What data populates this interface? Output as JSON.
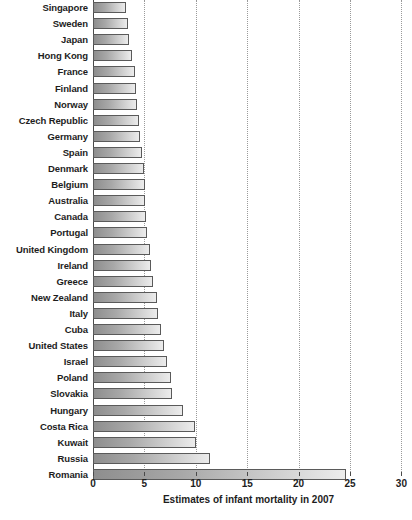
{
  "chart_data": {
    "type": "bar",
    "orientation": "horizontal",
    "title": "",
    "xlabel": "Estimates of infant mortality in 2007",
    "ylabel": "",
    "xlim": [
      0,
      30
    ],
    "xticks": [
      0,
      5,
      10,
      15,
      20,
      25,
      30
    ],
    "xtick_labels": [
      "0",
      "5",
      "10",
      "15",
      "20",
      "25",
      "30"
    ],
    "grid": true,
    "grid_axis": "x",
    "legend": "none",
    "bar_color": "#a8a8a8",
    "bar_edge_color": "#5a5a5a",
    "categories": [
      "Singapore",
      "Sweden",
      "Japan",
      "Hong Kong",
      "France",
      "Finland",
      "Norway",
      "Czech Republic",
      "Germany",
      "Spain",
      "Denmark",
      "Belgium",
      "Australia",
      "Canada",
      "Portugal",
      "United Kingdom",
      "Ireland",
      "Greece",
      "New Zealand",
      "Italy",
      "Cuba",
      "United States",
      "Israel",
      "Poland",
      "Slovakia",
      "Hungary",
      "Costa Rica",
      "Kuwait",
      "Russia",
      "Romania"
    ],
    "values": [
      3.2,
      3.4,
      3.5,
      3.8,
      4.1,
      4.2,
      4.3,
      4.5,
      4.6,
      4.8,
      5.0,
      5.1,
      5.1,
      5.2,
      5.3,
      5.5,
      5.6,
      5.8,
      6.2,
      6.3,
      6.6,
      6.9,
      7.2,
      7.6,
      7.7,
      8.8,
      9.9,
      10.0,
      11.4,
      24.6
    ]
  }
}
